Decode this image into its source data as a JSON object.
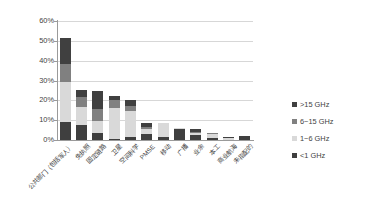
{
  "chart_data": {
    "type": "bar",
    "stacked": true,
    "title": "",
    "subtitle": "",
    "xlabel": "",
    "ylabel": "",
    "ylim": [
      0,
      60
    ],
    "ytick_labels": [
      "60%",
      "50%",
      "40%",
      "30%",
      "20%",
      "10%",
      "0%"
    ],
    "ytick_values": [
      60,
      50,
      40,
      30,
      20,
      10,
      0
    ],
    "ytick_suffix": "%",
    "grid": true,
    "legend_position": "right",
    "categories": [
      "公共部门（包括军人）",
      "免执照",
      "固定链路",
      "卫星",
      "空间科学",
      "PMSE",
      "移动",
      "广播",
      "业余",
      "本工",
      "商业航海",
      "未指配的"
    ],
    "series": [
      {
        "name": ">15 GHz",
        "color": "#404040",
        "values": [
          13.0,
          3.5,
          9.0,
          2.0,
          3.0,
          2.0,
          0.0,
          0.0,
          1.5,
          0.0,
          0.5,
          0.0
        ]
      },
      {
        "name": "6~15 GHz",
        "color": "#808080",
        "values": [
          9.0,
          5.0,
          6.0,
          4.0,
          2.5,
          1.0,
          0.0,
          0.0,
          0.5,
          0.5,
          0.0,
          0.0
        ]
      },
      {
        "name": "1~6 GHz",
        "color": "#d9d9d9",
        "values": [
          20.5,
          9.0,
          6.0,
          15.5,
          13.0,
          2.5,
          7.0,
          0.5,
          1.0,
          2.0,
          1.0,
          0.0
        ]
      },
      {
        "name": "<1 GHz",
        "color": "#3f3f3f",
        "values": [
          9.0,
          7.5,
          3.5,
          0.5,
          1.5,
          3.0,
          1.5,
          5.5,
          2.5,
          1.0,
          0.0,
          2.0
        ]
      }
    ],
    "totals": [
      51.5,
      25.0,
      24.5,
      22.0,
      20.0,
      8.5,
      8.5,
      6.0,
      5.5,
      3.5,
      1.5,
      2.0
    ]
  },
  "legend": {
    "items": [
      {
        "label": ">15 GHz",
        "color": "#404040"
      },
      {
        "label": "6~15 GHz",
        "color": "#808080"
      },
      {
        "label": "1~6 GHz",
        "color": "#d9d9d9"
      },
      {
        "label": "<1 GHz",
        "color": "#3f3f3f"
      }
    ]
  },
  "colors": {
    "background": "#ffffff",
    "gridline": "#d7d7d7",
    "axis": "#9a9a9a",
    "text": "#3f3f3f"
  }
}
